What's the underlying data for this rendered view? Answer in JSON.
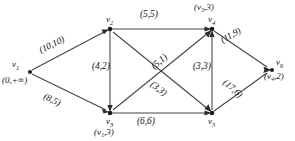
{
  "diagram": {
    "type": "network-flow-graph",
    "title": "",
    "nodes": [
      {
        "id": "v1",
        "name": "v",
        "sub": "1",
        "tag": "(0,+∞)",
        "x": 28,
        "y": 72,
        "name_dx": -16,
        "name_dy": -12,
        "tag_dx": -26,
        "tag_dy": 4
      },
      {
        "id": "v2",
        "name": "v",
        "sub": "2",
        "tag": "",
        "x": 110,
        "y": 29,
        "name_dx": -4,
        "name_dy": -14,
        "tag_dx": 0,
        "tag_dy": 0
      },
      {
        "id": "v3",
        "name": "v",
        "sub": "3",
        "tag": "(v₁,3)",
        "x": 110,
        "y": 113,
        "name_dx": -4,
        "name_dy": 4,
        "tag_dx": -16,
        "tag_dy": 14
      },
      {
        "id": "v4",
        "name": "v",
        "sub": "4",
        "tag": "(v₃,3)",
        "x": 212,
        "y": 29,
        "name_dx": -4,
        "name_dy": -14,
        "tag_dx": -18,
        "tag_dy": -25
      },
      {
        "id": "v5",
        "name": "v",
        "sub": "5",
        "tag": "",
        "x": 212,
        "y": 113,
        "name_dx": -4,
        "name_dy": 4,
        "tag_dx": 0,
        "tag_dy": 0
      },
      {
        "id": "v6",
        "name": "v",
        "sub": "6",
        "tag": "(v₄,2)",
        "x": 272,
        "y": 70,
        "name_dx": 4,
        "name_dy": -13,
        "tag_dx": -2,
        "tag_dy": 2
      }
    ],
    "edges": [
      {
        "from": "v1",
        "to": "v2",
        "capacity": 10,
        "flow": 10,
        "label": "(10,10)",
        "lx": 42,
        "ly": 56,
        "rot": "rot-up-26"
      },
      {
        "from": "v1",
        "to": "v3",
        "capacity": 8,
        "flow": 5,
        "label": "(8,5)",
        "lx": 46,
        "ly": 94,
        "rot": "rot-dn-26"
      },
      {
        "from": "v2",
        "to": "v4",
        "capacity": 5,
        "flow": 5,
        "label": "(5,5)",
        "lx": 144,
        "ly": 14,
        "rot": ""
      },
      {
        "from": "v2",
        "to": "v3",
        "capacity": 4,
        "flow": 2,
        "label": "(4,2)",
        "lx": 97,
        "ly": 65,
        "rot": ""
      },
      {
        "from": "v2",
        "to": "v5",
        "capacity": 3,
        "flow": 3,
        "label": "(3,3)",
        "lx": 157,
        "ly": 84,
        "rot": "rot-dn-37"
      },
      {
        "from": "v3",
        "to": "v4",
        "capacity": 5,
        "flow": 1,
        "label": "(5,1)",
        "lx": 160,
        "ly": 62,
        "rot": "rot-up-45"
      },
      {
        "from": "v3",
        "to": "v5",
        "capacity": 6,
        "flow": 6,
        "label": "(6,6)",
        "lx": 140,
        "ly": 118,
        "rot": ""
      },
      {
        "from": "v5",
        "to": "v4",
        "capacity": 3,
        "flow": 3,
        "label": "(3,3)",
        "lx": 198,
        "ly": 65,
        "rot": ""
      },
      {
        "from": "v4",
        "to": "v6",
        "capacity": 11,
        "flow": 9,
        "label": "(11,9)",
        "lx": 227,
        "ly": 41,
        "rot": "rot-up-30"
      },
      {
        "from": "v5",
        "to": "v6",
        "capacity": 17,
        "flow": 6,
        "label": "(17,6)",
        "lx": 230,
        "ly": 82,
        "rot": "rot-dn-45"
      }
    ],
    "colors": {
      "edge": "#444444",
      "node": "#1c1c1c",
      "text": "#111111",
      "background": "#ffffff"
    }
  }
}
